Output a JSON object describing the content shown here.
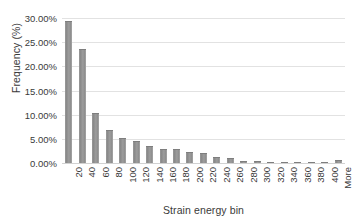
{
  "chart_data": {
    "type": "bar",
    "title": "",
    "subtitle": "",
    "xlabel": "Strain energy bin",
    "ylabel": "Frequency (%)",
    "categories": [
      "20",
      "40",
      "60",
      "80",
      "100",
      "120",
      "140",
      "160",
      "180",
      "200",
      "220",
      "240",
      "260",
      "280",
      "300",
      "320",
      "340",
      "360",
      "380",
      "400",
      "More"
    ],
    "values": [
      29.3,
      23.5,
      10.3,
      6.8,
      5.2,
      4.6,
      3.5,
      3.0,
      2.8,
      2.3,
      2.0,
      1.3,
      1.1,
      0.5,
      0.4,
      0.3,
      0.25,
      0.2,
      0.15,
      0.1,
      0.6
    ],
    "ylim": [
      0,
      30
    ],
    "ytick_values": [
      30,
      25,
      20,
      15,
      10,
      5,
      0
    ],
    "ytick_labels": [
      "30.00%",
      "25.00%",
      "20.00%",
      "15.00%",
      "10.00%",
      "5.00%",
      "0.00%"
    ],
    "grid": true,
    "legend": "none",
    "series_name": "Frequency",
    "bar_color": "#8f8f8f",
    "grid_color": "#e2e2e2",
    "text_color": "#3a3a3a",
    "background_color": "#ffffff"
  }
}
